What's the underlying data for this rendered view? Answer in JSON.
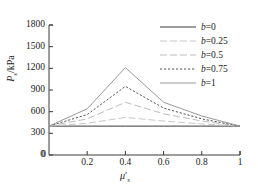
{
  "chart_data": {
    "type": "line",
    "title": "",
    "xlabel": "μ'_s",
    "ylabel": "P_s/kPa",
    "x": [
      0,
      0.2,
      0.4,
      0.6,
      0.8,
      1
    ],
    "xlim": [
      0,
      1
    ],
    "ylim": [
      0,
      1800
    ],
    "xticks": [
      0.2,
      0.4,
      0.6,
      0.8,
      1
    ],
    "yticks": [
      0,
      300,
      600,
      900,
      1200,
      1500,
      1800
    ],
    "grid": false,
    "legend_position": "top-right",
    "series": [
      {
        "name": "b=0",
        "values": [
          400,
          400,
          400,
          400,
          400,
          400
        ],
        "color": "#3a3a3a",
        "style": "solid"
      },
      {
        "name": "b=0.25",
        "values": [
          400,
          440,
          520,
          470,
          430,
          400
        ],
        "color": "#c8c8c8",
        "style": "longdash"
      },
      {
        "name": "b=0.5",
        "values": [
          400,
          500,
          730,
          570,
          470,
          400
        ],
        "color": "#bdbdbd",
        "style": "longdash"
      },
      {
        "name": "b=0.75",
        "values": [
          400,
          560,
          950,
          650,
          500,
          400
        ],
        "color": "#555555",
        "style": "shortdash"
      },
      {
        "name": "b=1",
        "values": [
          400,
          640,
          1210,
          730,
          540,
          400
        ],
        "color": "#9a9a9a",
        "style": "solid"
      }
    ]
  },
  "axes": {
    "ytick_labels": [
      "1800",
      "1500",
      "1200",
      "900",
      "600",
      "300",
      "0"
    ],
    "xtick_labels": [
      "0.2",
      "0.4",
      "0.6",
      "0.8",
      "1"
    ],
    "ylabel_p": "P",
    "ylabel_sub": "s",
    "ylabel_unit": "/kPa",
    "xlabel_mu": "μ",
    "xlabel_prime": "′",
    "xlabel_sub": "s"
  },
  "legend": {
    "items": [
      {
        "label_var": "b",
        "label_eq": "=0",
        "style": "solid",
        "color": "#3a3a3a"
      },
      {
        "label_var": "b",
        "label_eq": "=0.25",
        "style": "longdash",
        "color": "#c8c8c8"
      },
      {
        "label_var": "b",
        "label_eq": "=0.5",
        "style": "longdash",
        "color": "#bdbdbd"
      },
      {
        "label_var": "b",
        "label_eq": "=0.75",
        "style": "shortdash",
        "color": "#555555"
      },
      {
        "label_var": "b",
        "label_eq": "=1",
        "style": "solid",
        "color": "#9a9a9a"
      }
    ]
  },
  "colors": {
    "axis": "#3a3a3a",
    "background": "#ffffff"
  }
}
